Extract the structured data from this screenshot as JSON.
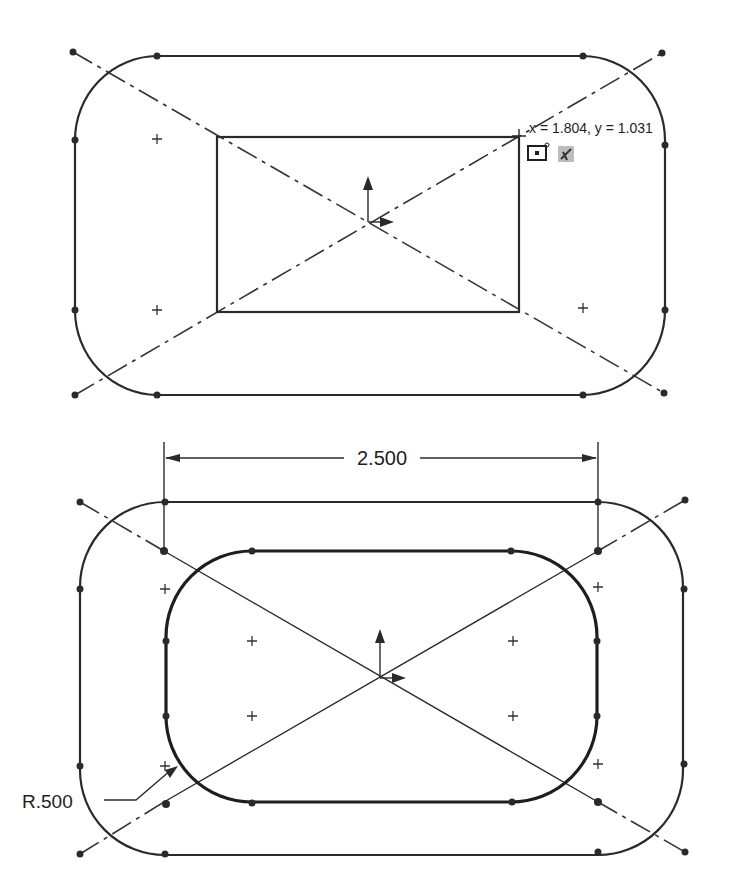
{
  "figures": {
    "top": {
      "description": "Sketch with rectangle centered on origin and offset rounded rectangle with construction diagonals",
      "cursor_readout": {
        "text": "x = 1.804, y = 1.031",
        "x_value": "1.804",
        "y_value": "1.031"
      },
      "cursor_icons": [
        "point-inference-icon",
        "coincident-relation-icon"
      ]
    },
    "bottom": {
      "description": "Sketch after offset with dimensions",
      "dimensions": {
        "width_label": "2.500",
        "radius_label": "R.500"
      }
    }
  },
  "colors": {
    "line": "#2a2a2a",
    "background": "#ffffff"
  }
}
